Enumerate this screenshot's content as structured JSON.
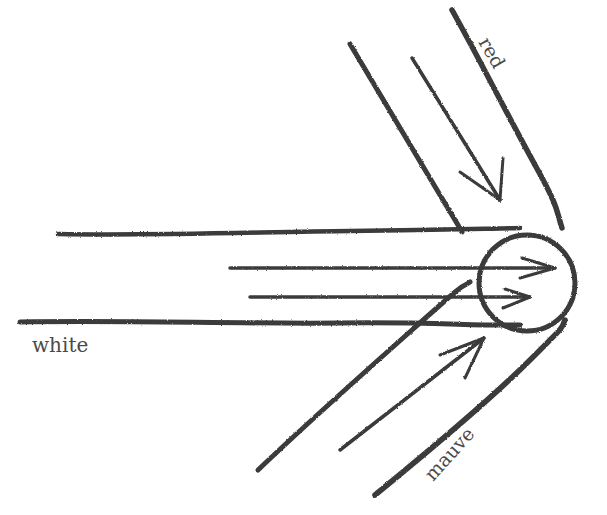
{
  "diagram": {
    "colors": {
      "background": "#ffffff",
      "ink": "#3a3a3a",
      "text": "#4a4a4a"
    },
    "labels": {
      "white": "white",
      "red": "red",
      "mauve": "mauve"
    },
    "target": {
      "shape": "circle",
      "cx": 527,
      "cy": 283,
      "r": 48
    },
    "beams": [
      {
        "name": "white",
        "direction": "from left (horizontal)",
        "edges": [
          {
            "x1": 58,
            "y1": 234,
            "x2": 520,
            "y2": 228
          },
          {
            "x1": 20,
            "y1": 322,
            "x2": 520,
            "y2": 325
          }
        ],
        "arrows": [
          {
            "x1": 230,
            "y1": 268,
            "x2": 555,
            "y2": 268
          },
          {
            "x1": 250,
            "y1": 297,
            "x2": 530,
            "y2": 297
          }
        ]
      },
      {
        "name": "red",
        "direction": "from upper-left (diagonal down-right)",
        "edges": [
          {
            "x1": 350,
            "y1": 44,
            "x2": 460,
            "y2": 228
          },
          {
            "x1": 452,
            "y1": 10,
            "x2": 560,
            "y2": 225
          }
        ],
        "arrows": [
          {
            "x1": 412,
            "y1": 58,
            "x2": 500,
            "y2": 200
          }
        ]
      },
      {
        "name": "mauve",
        "direction": "from lower-left (diagonal up-right)",
        "edges": [
          {
            "x1": 258,
            "y1": 470,
            "x2": 412,
            "y2": 330
          },
          {
            "x1": 375,
            "y1": 495,
            "x2": 560,
            "y2": 330
          }
        ],
        "arrows": [
          {
            "x1": 340,
            "y1": 450,
            "x2": 484,
            "y2": 338
          }
        ]
      }
    ]
  }
}
